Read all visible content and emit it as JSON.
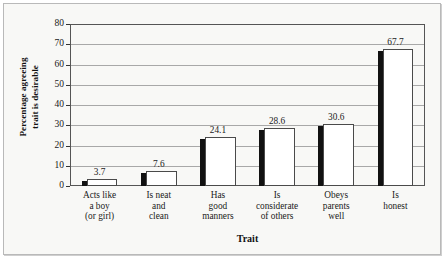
{
  "chart_data": {
    "type": "bar",
    "title": "",
    "xlabel": "Trait",
    "ylabel": "Percentage agreeing trait is desirable",
    "ylabel_line1": "Percentage agreeing",
    "ylabel_line2": "trait is desirable",
    "categories": [
      "Acts like a boy (or girl)",
      "Is neat and clean",
      "Has good manners",
      "Is considerate of others",
      "Obeys parents well",
      "Is honest"
    ],
    "category_lines": [
      [
        "Acts like",
        "a boy",
        "(or girl)"
      ],
      [
        "Is neat",
        "and",
        "clean"
      ],
      [
        "Has",
        "good",
        "manners"
      ],
      [
        "Is",
        "considerate",
        "of others"
      ],
      [
        "Obeys",
        "parents",
        "well"
      ],
      [
        "Is",
        "honest"
      ]
    ],
    "values": [
      3.7,
      7.6,
      24.1,
      28.6,
      30.6,
      67.7
    ],
    "value_labels": [
      "3.7",
      "7.6",
      "24.1",
      "28.6",
      "30.6",
      "67.7"
    ],
    "ylim": [
      0,
      80
    ],
    "ytick_step": 10,
    "yticks": [
      "0",
      "10",
      "20",
      "30",
      "40",
      "50",
      "60",
      "70",
      "80"
    ],
    "grid": true,
    "legend": "none",
    "bar_fill_color": "#ffffff",
    "bar_edge_color": "#4a4a4a",
    "bar_shadow_color": "#111111",
    "background_color": "#f8f8f6",
    "gridline_color": "#8e8e8e"
  }
}
